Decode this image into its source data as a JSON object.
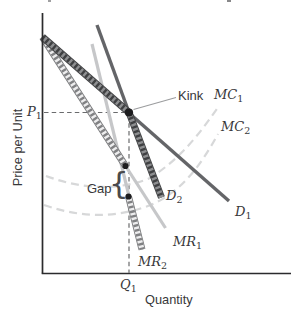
{
  "figure": {
    "y_axis_label": "Price per Unit",
    "x_axis_label": "Quantity",
    "labels": {
      "kink": "Kink",
      "gap": "Gap",
      "gap_brace": "{",
      "p1": {
        "base": "P",
        "sub": "1"
      },
      "q1": {
        "base": "Q",
        "sub": "1"
      },
      "mc1": {
        "base": "MC",
        "sub": "1"
      },
      "mc2": {
        "base": "MC",
        "sub": "2"
      },
      "d1": {
        "base": "D",
        "sub": "1"
      },
      "d2": {
        "base": "D",
        "sub": "2"
      },
      "mr1": {
        "base": "MR",
        "sub": "1"
      },
      "mr2": {
        "base": "MR",
        "sub": "2"
      }
    },
    "colors": {
      "axis": "#2b2b2d",
      "demand_line": "#646568",
      "mr_line": "#c6c7c9",
      "mc_curve": "#d7d8d9",
      "guide_dash": "#6a6b6d",
      "highlight_dark": "#3f4042",
      "highlight_light": "#ededee",
      "dot": "#1d1d1f",
      "text": "#38383a"
    },
    "description": {
      "type": "kinked-demand-curve-diagram",
      "curves": [
        {
          "id": "D1",
          "style": "solid dark line",
          "role": "flatter demand curve; hatched highlight above the kink"
        },
        {
          "id": "D2",
          "style": "solid dark line",
          "role": "steeper demand curve; hatched highlight below the kink"
        },
        {
          "id": "MR1",
          "style": "solid light line",
          "role": "marginal revenue for D1; hatched highlight down to top of gap"
        },
        {
          "id": "MR2",
          "style": "solid light line",
          "role": "marginal revenue for D2; hatched highlight below bottom of gap"
        },
        {
          "id": "MC1",
          "style": "dashed light curve"
        },
        {
          "id": "MC2",
          "style": "dashed light curve"
        }
      ],
      "points": [
        {
          "id": "Kink",
          "at": "intersection of D1 and D2 at price P1, quantity Q1"
        },
        {
          "id": "Gap",
          "at": "vertical discontinuity in marginal revenue at Q1, marked with brace"
        }
      ]
    }
  }
}
